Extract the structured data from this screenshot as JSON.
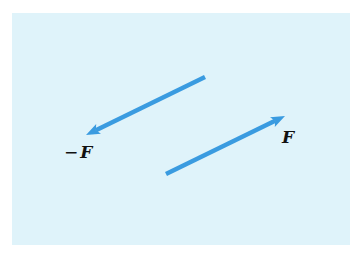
{
  "figure": {
    "background_color": "#dff3fa",
    "arrow_color": "#3a9be0",
    "label_color": "#111111",
    "panel": {
      "x": 12,
      "y": 13,
      "width": 338,
      "height": 232
    },
    "vectors": [
      {
        "id": "neg-force",
        "label_prefix": "−",
        "label_symbol": "F",
        "tail": [
          205,
          77
        ],
        "head": [
          86,
          135
        ],
        "label_pos": [
          64,
          158
        ]
      },
      {
        "id": "force",
        "label_prefix": "",
        "label_symbol": "F",
        "tail": [
          166,
          174
        ],
        "head": [
          285,
          116
        ],
        "label_pos": [
          282,
          143
        ]
      }
    ]
  }
}
